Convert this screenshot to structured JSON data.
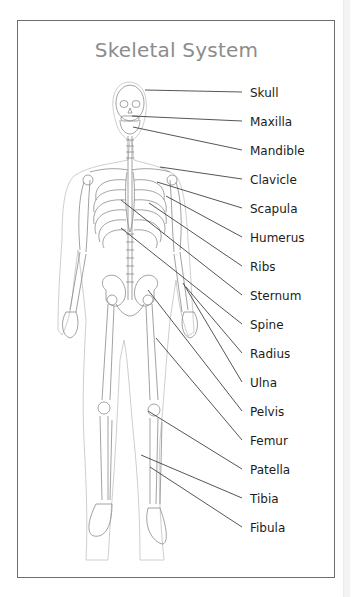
{
  "diagram": {
    "title": "Skeletal System",
    "frame_color": "#6e6e6e",
    "title_color": "#8c8c8c",
    "labels": [
      {
        "text": "Skull",
        "y": 86,
        "from": [
          145,
          90
        ]
      },
      {
        "text": "Maxilla",
        "y": 115,
        "from": [
          132,
          116
        ]
      },
      {
        "text": "Mandible",
        "y": 144,
        "from": [
          133,
          127
        ]
      },
      {
        "text": "Clavicle",
        "y": 173,
        "from": [
          160,
          167
        ]
      },
      {
        "text": "Scapula",
        "y": 202,
        "from": [
          157,
          182
        ]
      },
      {
        "text": "Humerus",
        "y": 231,
        "from": [
          166,
          196
        ]
      },
      {
        "text": "Ribs",
        "y": 260,
        "from": [
          149,
          203
        ]
      },
      {
        "text": "Sternum",
        "y": 289,
        "from": [
          121,
          200
        ]
      },
      {
        "text": "Spine",
        "y": 318,
        "from": [
          121,
          228
        ]
      },
      {
        "text": "Radius",
        "y": 347,
        "from": [
          186,
          287
        ]
      },
      {
        "text": "Ulna",
        "y": 376,
        "from": [
          183,
          283
        ]
      },
      {
        "text": "Pelvis",
        "y": 405,
        "from": [
          148,
          290
        ]
      },
      {
        "text": "Femur",
        "y": 434,
        "from": [
          156,
          338
        ]
      },
      {
        "text": "Patella",
        "y": 463,
        "from": [
          148,
          411
        ]
      },
      {
        "text": "Tibia",
        "y": 492,
        "from": [
          141,
          455
        ]
      },
      {
        "text": "Fibula",
        "y": 521,
        "from": [
          150,
          467
        ]
      }
    ]
  }
}
